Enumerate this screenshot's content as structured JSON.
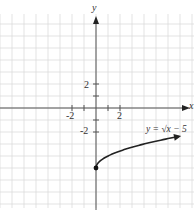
{
  "chart_data": {
    "type": "line",
    "title": "",
    "function_label": "y = √x − 5",
    "xlabel": "x",
    "ylabel": "y",
    "x_tick_labels": [
      "-2",
      "2"
    ],
    "y_tick_labels": [
      "2",
      "-2"
    ],
    "grid": true,
    "grid_step": 1,
    "xlim": [
      -8,
      8
    ],
    "ylim": [
      -9,
      8
    ],
    "series": [
      {
        "name": "y = √x − 5",
        "x": [
          0,
          0.25,
          1,
          2,
          4,
          6,
          9,
          12,
          15
        ],
        "y": [
          -5,
          -4.5,
          -4,
          -3.59,
          -3,
          -2.55,
          -2,
          -1.54,
          -1.13
        ],
        "start_point": {
          "x": 0,
          "y": -5,
          "filled": true
        },
        "end_arrow": true
      }
    ],
    "colors": {
      "grid": "#d9d9d9",
      "axis": "#555555",
      "curve": "#222222"
    }
  }
}
